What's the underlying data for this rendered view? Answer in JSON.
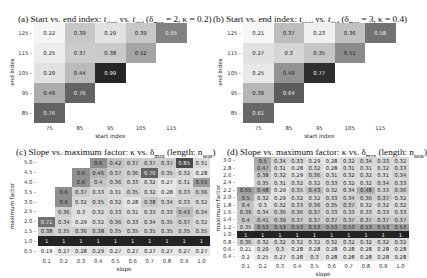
{
  "chart_data": [
    {
      "type": "heatmap",
      "panel": "a",
      "title": "(a) Start vs. end index: t_start vs. t_end (δ_max = 2, κ = 0.2)",
      "title_parts": {
        "prefix": "(a) Start vs. end index: ",
        "t1": "t",
        "s1": "start",
        "mid": " vs. ",
        "t2": "t",
        "s2": "end",
        "suffix": " (δ",
        "s3": "max",
        "rest": " = 2, κ = 0.2)"
      },
      "xlabel": "start index",
      "ylabel": "end index",
      "x": [
        "75",
        "85",
        "95",
        "105",
        "115"
      ],
      "y": [
        "125",
        "115",
        "105",
        "95",
        "85"
      ],
      "values": [
        [
          0.22,
          0.39,
          0.29,
          0.39,
          0.65
        ],
        [
          0.25,
          0.37,
          0.38,
          0.52,
          null
        ],
        [
          0.29,
          0.44,
          0.99,
          null,
          null
        ],
        [
          0.49,
          0.76,
          null,
          null,
          null
        ],
        [
          0.76,
          null,
          null,
          null,
          null
        ]
      ],
      "vmin": 0.2,
      "vmax": 1.0
    },
    {
      "type": "heatmap",
      "panel": "b",
      "title": "(b) Start vs. end index: t_start vs. t_end (δ_max = 3, κ = 0.4)",
      "title_parts": {
        "prefix": "(b) Start vs. end index: ",
        "t1": "t",
        "s1": "start",
        "mid": " vs. ",
        "t2": "t",
        "s2": "end",
        "suffix": " (δ",
        "s3": "max",
        "rest": " = 3, κ = 0.4)"
      },
      "xlabel": "start index",
      "ylabel": "end index",
      "x": [
        "75",
        "85",
        "95",
        "105",
        "115"
      ],
      "y": [
        "125",
        "115",
        "105",
        "95",
        "85"
      ],
      "values": [
        [
          0.21,
          0.37,
          0.23,
          0.36,
          0.58
        ],
        [
          0.27,
          0.3,
          0.35,
          0.51,
          null
        ],
        [
          0.25,
          0.49,
          0.77,
          null,
          null
        ],
        [
          0.39,
          0.64,
          null,
          null,
          null
        ],
        [
          0.61,
          null,
          null,
          null,
          null
        ]
      ],
      "vmin": 0.2,
      "vmax": 0.8
    },
    {
      "type": "heatmap",
      "panel": "c",
      "title": "(c) Slope vs. maximum factor: κ vs. δ_max (length: n_seas)",
      "title_parts": {
        "prefix": "(c) Slope vs. maximum factor: κ vs. δ",
        "s1": "max",
        "rest": " (length: n",
        "s2": "seas",
        "end": ")"
      },
      "xlabel": "slope",
      "ylabel": "maximum factor",
      "x": [
        "0.1",
        "0.2",
        "0.3",
        "0.4",
        "0.5",
        "0.6",
        "0.7",
        "0.8",
        "0.9",
        "1.0"
      ],
      "y": [
        "5.0",
        "4.5",
        "4.0",
        "3.5",
        "3.0",
        "2.5",
        "2.0",
        "1.5",
        "1.0",
        "0.5"
      ],
      "values": [
        [
          null,
          null,
          null,
          0.6,
          0.42,
          0.37,
          0.37,
          0.37,
          0.85,
          0.31
        ],
        [
          null,
          null,
          0.6,
          0.46,
          0.37,
          0.36,
          0.76,
          0.35,
          0.32,
          0.28
        ],
        [
          null,
          null,
          0.6,
          0.4,
          0.36,
          0.33,
          0.32,
          0.27,
          0.31,
          0.55
        ],
        [
          null,
          0.6,
          0.37,
          0.33,
          0.31,
          0.35,
          0.32,
          0.28,
          0.33,
          0.36
        ],
        [
          null,
          0.6,
          0.32,
          0.35,
          0.32,
          0.28,
          0.38,
          0.34,
          0.33,
          0.32
        ],
        [
          null,
          0.36,
          0.3,
          0.32,
          0.33,
          0.31,
          0.33,
          0.33,
          0.43,
          0.34
        ],
        [
          0.71,
          0.34,
          0.29,
          0.32,
          0.36,
          0.33,
          0.34,
          0.35,
          0.37,
          0.32
        ],
        [
          0.38,
          0.35,
          0.36,
          0.38,
          0.35,
          0.35,
          0.35,
          0.35,
          0.35,
          0.35
        ],
        [
          1,
          1,
          1,
          1,
          1,
          1,
          1,
          1,
          1,
          1
        ],
        [
          0.19,
          0.27,
          0.28,
          0.29,
          0.27,
          0.27,
          0.27,
          0.27,
          0.27,
          0.27
        ]
      ],
      "vmin": 0.2,
      "vmax": 1.0
    },
    {
      "type": "heatmap",
      "panel": "d",
      "title": "(d) Slope vs. maximum factor: κ vs. δ_max (length: n_seas)",
      "title_parts": {
        "prefix": "(d) Slope vs. maximum factor: κ vs. δ",
        "s1": "max",
        "rest": " (length: n",
        "s2": "seas",
        "end": ")"
      },
      "xlabel": "slope",
      "ylabel": "maximum factor",
      "x": [
        "0.1",
        "0.2",
        "0.3",
        "0.4",
        "0.5",
        "0.6",
        "0.7",
        "0.8",
        "0.9",
        "1.0"
      ],
      "y": [
        "3.0",
        "2.8",
        "2.6",
        "2.4",
        "2.2",
        "2.0",
        "1.8",
        "1.6",
        "1.4",
        "1.2",
        "1.0",
        "0.8",
        "0.6",
        "0.4"
      ],
      "values": [
        [
          null,
          0.5,
          0.34,
          0.33,
          0.29,
          0.28,
          0.32,
          0.34,
          0.33,
          0.32
        ],
        [
          null,
          0.47,
          0.31,
          0.28,
          0.32,
          0.28,
          0.31,
          0.31,
          0.32,
          0.33
        ],
        [
          null,
          0.38,
          0.32,
          0.29,
          0.36,
          0.31,
          0.32,
          0.32,
          0.31,
          0.34
        ],
        [
          null,
          0.35,
          0.31,
          0.32,
          0.32,
          0.33,
          0.32,
          0.32,
          0.34,
          0.33
        ],
        [
          0.55,
          0.48,
          0.29,
          0.35,
          0.43,
          0.32,
          0.34,
          0.48,
          0.33,
          0.36
        ],
        [
          0.5,
          0.32,
          0.29,
          0.32,
          0.32,
          0.33,
          0.34,
          0.36,
          0.37,
          0.32
        ],
        [
          0.4,
          0.3,
          0.32,
          0.33,
          0.36,
          0.35,
          0.37,
          0.32,
          0.32,
          0.32
        ],
        [
          0.39,
          0.34,
          0.36,
          0.36,
          0.37,
          0.33,
          0.33,
          0.33,
          0.33,
          0.33
        ],
        [
          0.4,
          0.41,
          0.39,
          0.37,
          0.37,
          0.37,
          0.37,
          0.37,
          0.37,
          0.37
        ],
        [
          0.35,
          0.53,
          0.53,
          0.53,
          0.53,
          0.53,
          0.53,
          0.53,
          0.53,
          0.53
        ],
        [
          1,
          1,
          1,
          1,
          1,
          1,
          1,
          1,
          1,
          1
        ],
        [
          0.36,
          0.32,
          0.32,
          0.32,
          0.32,
          0.32,
          0.32,
          0.32,
          0.32,
          0.32
        ],
        [
          0.21,
          0.29,
          0.3,
          0.28,
          0.28,
          0.28,
          0.28,
          0.28,
          0.28,
          0.28
        ],
        [
          0.2,
          0.25,
          0.27,
          0.28,
          0.3,
          0.28,
          0.28,
          0.28,
          0.28,
          0.28
        ]
      ],
      "vmin": 0.2,
      "vmax": 1.0
    }
  ]
}
